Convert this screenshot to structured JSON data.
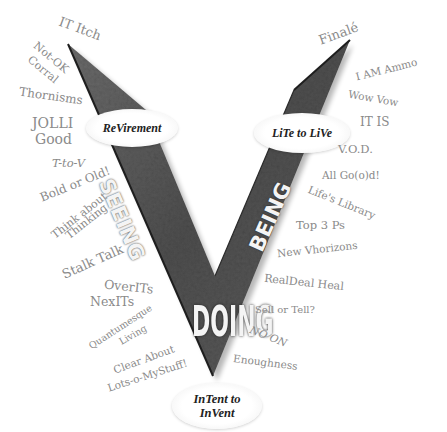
{
  "diagram": {
    "type": "V-shape concept diagram",
    "arms": {
      "left": "SEEING",
      "right": "BEING",
      "bottom": "DOING"
    },
    "ovals": {
      "left": "ReVirement",
      "right": "LiTe to LiVe",
      "bottom_line1": "InTent to",
      "bottom_line2": "InVent"
    },
    "left_words": [
      "IT Itch",
      "Not-OK",
      "Corral",
      "Thornisms",
      "JOLLI",
      "Good",
      "T-to-V",
      "Bold or Old!",
      "Think about",
      "Thinking",
      "Stalk Talk",
      "OverITs",
      "NexITs",
      "Quantumesque",
      "Living",
      "Clear About",
      "Lots-o-MyStuff!"
    ],
    "right_words": [
      "Finalé",
      "I AM Ammo",
      "Wow Vow",
      "IT IS",
      "V.O.D.",
      "All Go(o)d!",
      "Life's Library",
      "Top 3 Ps",
      "New Vhorizons",
      "RealDeal Heal",
      "Sell or Tell?",
      "NO ON",
      "Enoughness"
    ],
    "colors": {
      "word_text": "#8a8a8a",
      "v_fill_dark": "#4a4a4a",
      "v_fill_mid": "#7a7a7a",
      "arm_label": "#f4f4f4",
      "oval_text": "#222222"
    }
  }
}
